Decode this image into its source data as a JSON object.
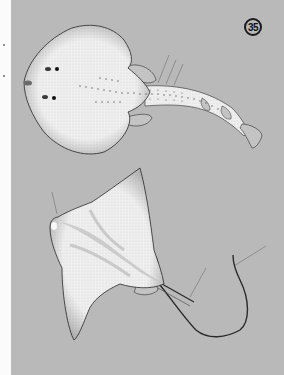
{
  "plate": {
    "number": "35",
    "background_color": "#b9b9b9",
    "margin_color": "#fbfbfb"
  },
  "illustrations": [
    {
      "id": "upper",
      "subject": "ray-dorsal-view",
      "description": "Stippled ink drawing of a rounded-disc ray with thick tail, two dorsal fins and caudal fin, with three leader lines"
    },
    {
      "id": "lower",
      "subject": "eagle-ray-dorsal-view",
      "description": "Stippled ink drawing of an eagle ray with pointed pectoral fins and long whip-like tail, with three leader lines"
    }
  ],
  "colors": {
    "ink": "#2a2a2a",
    "body_fill": "#eeeeee",
    "shade": "#9a9a9a",
    "leader_line": "#7a7a7a"
  }
}
